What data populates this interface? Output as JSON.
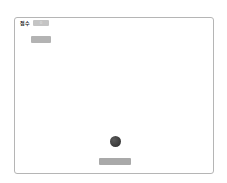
{
  "game": {
    "score_label": "점수",
    "score_value": "0",
    "start_button_label": "",
    "colors": {
      "frame_border": "#b5b5b5",
      "ball": "#333333",
      "paddle": "#a9a9a9",
      "score_box": "#c4c4c4",
      "button": "#b3b3b3"
    }
  }
}
